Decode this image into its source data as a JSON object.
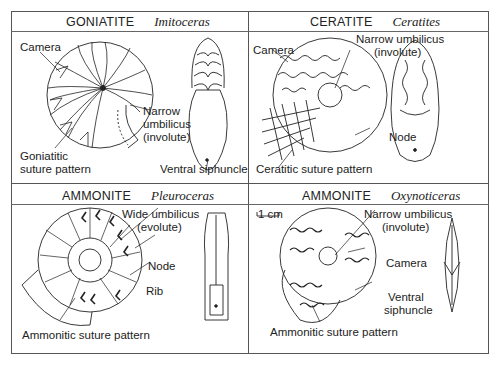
{
  "figure": {
    "panels": [
      {
        "group": "GONIATITE",
        "genus": "Imitoceras",
        "labels": {
          "camera": "Camera",
          "umbilicus_1": "Narrow",
          "umbilicus_2": "umbilicus",
          "umbilicus_3": "(involute)",
          "suture_1": "Goniatitic",
          "suture_2": "suture pattern",
          "siphuncle": "Ventral siphuncle"
        }
      },
      {
        "group": "CERATITE",
        "genus": "Ceratites",
        "labels": {
          "camera": "Camera",
          "umbilicus_1": "Narrow umbilicus",
          "umbilicus_2": "(involute)",
          "node": "Node",
          "suture": "Ceratitic suture pattern"
        }
      },
      {
        "group": "AMMONITE",
        "genus": "Pleuroceras",
        "labels": {
          "umbilicus_1": "Wide umbilicus",
          "umbilicus_2": "(evolute)",
          "node": "Node",
          "rib": "Rib",
          "suture": "Ammonitic suture pattern"
        }
      },
      {
        "group": "AMMONITE",
        "genus": "Oxynoticeras",
        "labels": {
          "scale": "1 cm",
          "umbilicus_1": "Narrow umbilicus",
          "umbilicus_2": "(involute)",
          "camera": "Camera",
          "siphuncle_1": "Ventral",
          "siphuncle_2": "siphuncle",
          "suture": "Ammonitic suture pattern"
        }
      }
    ]
  }
}
